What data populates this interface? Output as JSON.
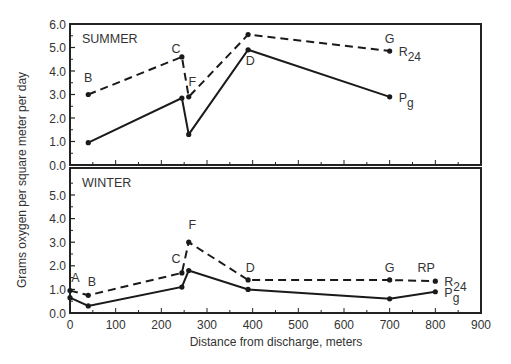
{
  "chart_data": {
    "type": "line",
    "xlabel": "Distance from discharge, meters",
    "ylabel": "Grams oxygen per square meter per day",
    "xlim": [
      0,
      900
    ],
    "xticks": [
      0,
      100,
      200,
      300,
      400,
      500,
      600,
      700,
      800,
      900
    ],
    "grid": false,
    "panels": [
      {
        "title": "SUMMER",
        "ylim": [
          0,
          6
        ],
        "yticks": [
          "0.0",
          "1.0",
          "2.0",
          "3.0",
          "4.0",
          "5.0",
          "6.0"
        ],
        "station_labels": [
          {
            "text": "B",
            "x": 40,
            "y": 3.55
          },
          {
            "text": "C",
            "x": 232,
            "y": 4.75
          },
          {
            "text": "F",
            "x": 268,
            "y": 3.35
          },
          {
            "text": "D",
            "x": 395,
            "y": 4.25
          },
          {
            "text": "G",
            "x": 700,
            "y": 5.2
          }
        ],
        "series": [
          {
            "name": "R24",
            "style": "dashed",
            "x": [
              40,
              245,
              260,
              390,
              700
            ],
            "values": [
              3.0,
              4.6,
              2.9,
              5.55,
              4.85
            ]
          },
          {
            "name": "Pg",
            "style": "solid",
            "x": [
              40,
              245,
              260,
              390,
              700
            ],
            "values": [
              0.95,
              2.85,
              1.3,
              4.9,
              2.9
            ]
          }
        ]
      },
      {
        "title": "WINTER",
        "ylim": [
          0,
          6
        ],
        "yticks": [
          "0.0",
          "1.0",
          "2.0",
          "3.0",
          "4.0",
          "5.0"
        ],
        "station_labels": [
          {
            "text": "A",
            "x": 12,
            "y": 1.3
          },
          {
            "text": "B",
            "x": 48,
            "y": 1.15
          },
          {
            "text": "C",
            "x": 232,
            "y": 2.1
          },
          {
            "text": "F",
            "x": 268,
            "y": 3.55
          },
          {
            "text": "D",
            "x": 395,
            "y": 1.75
          },
          {
            "text": "G",
            "x": 700,
            "y": 1.75
          },
          {
            "text": "RP",
            "x": 780,
            "y": 1.75
          }
        ],
        "series": [
          {
            "name": "R24",
            "style": "dashed",
            "x": [
              0,
              40,
              245,
              260,
              390,
              700,
              800
            ],
            "values": [
              0.95,
              0.75,
              1.7,
              3.0,
              1.4,
              1.4,
              1.35
            ]
          },
          {
            "name": "Pg",
            "style": "solid",
            "x": [
              0,
              40,
              245,
              260,
              390,
              700,
              800
            ],
            "values": [
              0.65,
              0.3,
              1.1,
              1.8,
              1.0,
              0.6,
              0.9
            ]
          }
        ]
      }
    ],
    "series_labels": {
      "R24": {
        "main": "R",
        "sub": "24"
      },
      "Pg": {
        "main": "P",
        "sub": "g"
      }
    }
  },
  "style": {
    "line_color": "#1a1a1a",
    "frame_color": "#222222",
    "text_color": "#333333"
  }
}
